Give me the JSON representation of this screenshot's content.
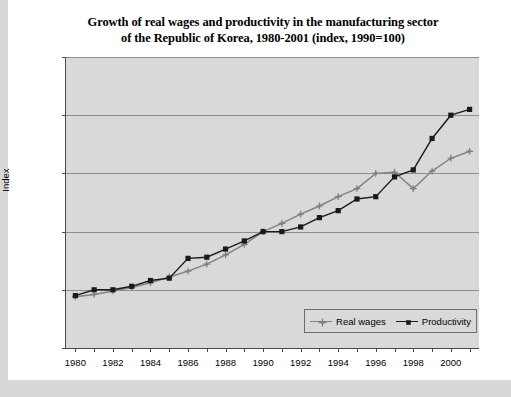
{
  "chart_data": {
    "type": "line",
    "title": "Growth of real wages and productivity in the manufacturing sector of the Republic of Korea, 1980-2001 (index, 1990=100)",
    "title_line1": "Growth of real wages and productivity in the manufacturing sector",
    "title_line2": "of the Republic of Korea, 1980-2001 (index, 1990=100)",
    "xlabel": "",
    "ylabel": "Index",
    "ylim": [
      0,
      250
    ],
    "xlim": [
      1979.5,
      2001.5
    ],
    "yticks": [
      "0.0",
      "50.0",
      "100.0",
      "150.0",
      "200.0",
      "250.0"
    ],
    "ytick_values": [
      0,
      50,
      100,
      150,
      200,
      250
    ],
    "xticks": [
      "1980",
      "1982",
      "1984",
      "1986",
      "1988",
      "1990",
      "1992",
      "1994",
      "1996",
      "1998",
      "2000"
    ],
    "xtick_values": [
      1980,
      1982,
      1984,
      1986,
      1988,
      1990,
      1992,
      1994,
      1996,
      1998,
      2000
    ],
    "grid": true,
    "legend_position": "lower right",
    "x": [
      1980,
      1981,
      1982,
      1983,
      1984,
      1985,
      1986,
      1987,
      1988,
      1989,
      1990,
      1991,
      1992,
      1993,
      1994,
      1995,
      1996,
      1997,
      1998,
      1999,
      2000,
      2001
    ],
    "series": [
      {
        "name": "Real wages",
        "color": "#808080",
        "marker": "cross",
        "values": [
          44,
          46,
          49,
          52,
          56,
          61,
          66,
          72,
          80,
          89,
          100,
          107,
          115,
          122,
          130,
          137,
          150,
          151,
          137,
          152,
          163,
          169
        ]
      },
      {
        "name": "Productivity",
        "color": "#1a1a1a",
        "marker": "square",
        "values": [
          45,
          50,
          50,
          53,
          58,
          60,
          77,
          78,
          85,
          92,
          100,
          100,
          104,
          112,
          118,
          128,
          130,
          147,
          153,
          180,
          200,
          205
        ]
      }
    ]
  },
  "legend": {
    "entries": [
      {
        "label": "Real wages"
      },
      {
        "label": "Productivity"
      }
    ]
  },
  "axes": {
    "y_axis_title": "Index"
  },
  "colors": {
    "real_wages": "#808080",
    "productivity": "#1a1a1a",
    "plot_background": "#d9d9d9",
    "gridline": "#8e8e8e",
    "page_background": "#d8d8d8",
    "card_background": "#ffffff"
  }
}
